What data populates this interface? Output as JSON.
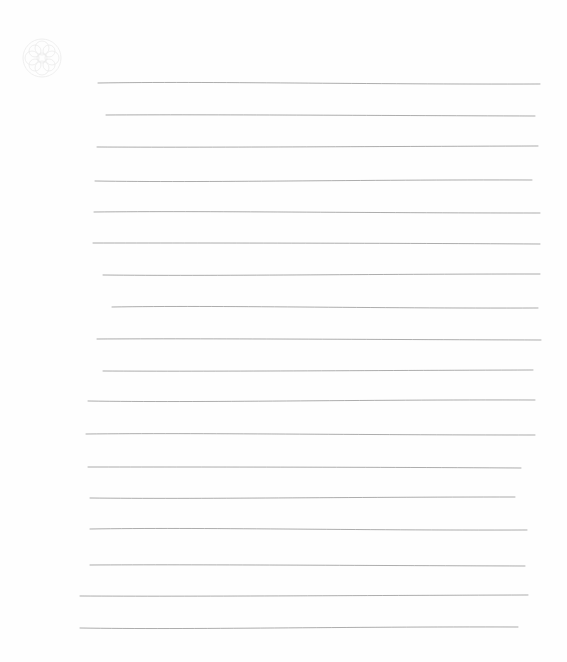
{
  "sheet": {
    "background": "#fefefe",
    "pencil_color": "#8a8a8a",
    "ornament": {
      "icon": "rosette-icon",
      "color": "#d8d8d8"
    }
  },
  "ruled_lines": [
    {
      "y": 83,
      "x1": 98,
      "x2": 540
    },
    {
      "y": 115,
      "x1": 106,
      "x2": 535
    },
    {
      "y": 147,
      "x1": 97,
      "x2": 538
    },
    {
      "y": 181,
      "x1": 95,
      "x2": 532
    },
    {
      "y": 212,
      "x1": 94,
      "x2": 540
    },
    {
      "y": 243,
      "x1": 93,
      "x2": 540
    },
    {
      "y": 275,
      "x1": 103,
      "x2": 540
    },
    {
      "y": 307,
      "x1": 112,
      "x2": 538
    },
    {
      "y": 339,
      "x1": 97,
      "x2": 541
    },
    {
      "y": 371,
      "x1": 103,
      "x2": 533
    },
    {
      "y": 401,
      "x1": 88,
      "x2": 535
    },
    {
      "y": 434,
      "x1": 86,
      "x2": 535
    },
    {
      "y": 467,
      "x1": 88,
      "x2": 521
    },
    {
      "y": 498,
      "x1": 90,
      "x2": 515
    },
    {
      "y": 529,
      "x1": 90,
      "x2": 527
    },
    {
      "y": 565,
      "x1": 90,
      "x2": 525
    },
    {
      "y": 596,
      "x1": 80,
      "x2": 528
    },
    {
      "y": 628,
      "x1": 80,
      "x2": 518
    }
  ]
}
